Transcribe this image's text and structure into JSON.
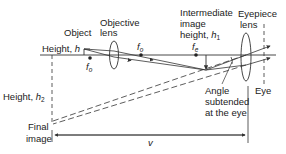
{
  "diagram": {
    "type": "compound-microscope-ray-diagram",
    "labels": {
      "object": "Object",
      "objective_lens_line1": "Objective",
      "objective_lens_line2": "lens",
      "height_h_prefix": "Height, ",
      "height_h_var": "h",
      "f_o_left": "f",
      "f_o_left_sub": "o",
      "f_o_right": "f",
      "f_o_right_sub": "o",
      "f_e": "f",
      "f_e_sub": "e",
      "intermediate_line1": "Intermediate",
      "intermediate_line2": "image",
      "intermediate_line3_prefix": "height, ",
      "intermediate_line3_var": "h",
      "intermediate_line3_sub": "1",
      "eyepiece_line1": "Eyepiece",
      "eyepiece_line2": "lens",
      "height_h2_prefix": "Height, ",
      "height_h2_var": "h",
      "height_h2_sub": "2",
      "angle_line1": "Angle",
      "angle_line2": "subtended",
      "angle_line3": "at the eye",
      "eye": "Eye",
      "final_line1": "Final",
      "final_line2": "image",
      "v": "v"
    },
    "colors": {
      "line": "#333333",
      "text": "#222222",
      "background": "#ffffff"
    }
  }
}
